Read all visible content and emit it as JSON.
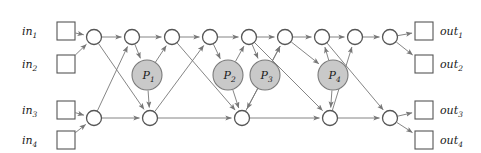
{
  "diagram": {
    "colors": {
      "edge": "#777777",
      "node_stroke": "#555555",
      "node_fill": "#ffffff",
      "processor_fill": "#c9c9c9",
      "processor_stroke": "#7a7a7a",
      "background": "#ffffff",
      "text": "#1a1a1a"
    },
    "inputs": [
      {
        "id": "in1",
        "base": "in",
        "sub": "1",
        "x": 57,
        "y": 22,
        "size": 18
      },
      {
        "id": "in2",
        "base": "in",
        "sub": "2",
        "x": 57,
        "y": 55,
        "size": 18
      },
      {
        "id": "in3",
        "base": "in",
        "sub": "3",
        "x": 57,
        "y": 101,
        "size": 18
      },
      {
        "id": "in4",
        "base": "in",
        "sub": "4",
        "x": 57,
        "y": 131,
        "size": 18
      }
    ],
    "outputs": [
      {
        "id": "out1",
        "base": "out",
        "sub": "1",
        "x": 415,
        "y": 22,
        "size": 18
      },
      {
        "id": "out2",
        "base": "out",
        "sub": "2",
        "x": 415,
        "y": 55,
        "size": 18
      },
      {
        "id": "out3",
        "base": "out",
        "sub": "3",
        "x": 415,
        "y": 101,
        "size": 18
      },
      {
        "id": "out4",
        "base": "out",
        "sub": "4",
        "x": 415,
        "y": 131,
        "size": 18
      }
    ],
    "input_labels": [
      {
        "text": "in",
        "sub": "1",
        "x": 22,
        "y": 35
      },
      {
        "text": "in",
        "sub": "2",
        "x": 22,
        "y": 68
      },
      {
        "text": "in",
        "sub": "3",
        "x": 22,
        "y": 114
      },
      {
        "text": "in",
        "sub": "4",
        "x": 22,
        "y": 144
      }
    ],
    "output_labels": [
      {
        "text": "out",
        "sub": "1",
        "x": 440,
        "y": 35
      },
      {
        "text": "out",
        "sub": "2",
        "x": 440,
        "y": 68
      },
      {
        "text": "out",
        "sub": "3",
        "x": 440,
        "y": 114
      },
      {
        "text": "out",
        "sub": "4",
        "x": 440,
        "y": 144
      }
    ],
    "top_nodes": [
      {
        "id": "t1",
        "x": 94,
        "y": 37,
        "r": 7.5
      },
      {
        "id": "t2",
        "x": 132,
        "y": 37,
        "r": 7.5
      },
      {
        "id": "t3",
        "x": 172,
        "y": 37,
        "r": 7.5
      },
      {
        "id": "t4",
        "x": 210,
        "y": 37,
        "r": 7.5
      },
      {
        "id": "t5",
        "x": 249,
        "y": 37,
        "r": 7.5
      },
      {
        "id": "t6",
        "x": 285,
        "y": 37,
        "r": 7.5
      },
      {
        "id": "t7",
        "x": 322,
        "y": 37,
        "r": 7.5
      },
      {
        "id": "t8",
        "x": 355,
        "y": 37,
        "r": 7.5
      },
      {
        "id": "t9",
        "x": 390,
        "y": 37,
        "r": 7.5
      }
    ],
    "bottom_nodes": [
      {
        "id": "b1",
        "x": 94,
        "y": 118,
        "r": 7.5
      },
      {
        "id": "b2",
        "x": 150,
        "y": 118,
        "r": 7.5
      },
      {
        "id": "b3",
        "x": 242,
        "y": 118,
        "r": 7.5
      },
      {
        "id": "b4",
        "x": 330,
        "y": 118,
        "r": 7.5
      },
      {
        "id": "b5",
        "x": 390,
        "y": 118,
        "r": 7.5
      }
    ],
    "processors": [
      {
        "id": "P1",
        "base": "P",
        "sub": "1",
        "x": 147,
        "y": 75,
        "r": 15
      },
      {
        "id": "P2",
        "base": "P",
        "sub": "2",
        "x": 228,
        "y": 75,
        "r": 15
      },
      {
        "id": "P3",
        "base": "P",
        "sub": "3",
        "x": 265,
        "y": 75,
        "r": 15
      },
      {
        "id": "P4",
        "base": "P",
        "sub": "4",
        "x": 333,
        "y": 75,
        "r": 15
      }
    ],
    "edges": [
      {
        "from": "in1",
        "to": "t1",
        "kind": "input-fanin"
      },
      {
        "from": "in2",
        "to": "t1",
        "kind": "input-fanin"
      },
      {
        "from": "in3",
        "to": "b1",
        "kind": "input-fanin"
      },
      {
        "from": "in4",
        "to": "b1",
        "kind": "input-fanin"
      },
      {
        "from": "t1",
        "to": "t2",
        "kind": "top-chain"
      },
      {
        "from": "t2",
        "to": "t3",
        "kind": "top-chain"
      },
      {
        "from": "t3",
        "to": "t4",
        "kind": "top-chain"
      },
      {
        "from": "t4",
        "to": "t5",
        "kind": "top-chain"
      },
      {
        "from": "t5",
        "to": "t6",
        "kind": "top-chain"
      },
      {
        "from": "t6",
        "to": "t7",
        "kind": "top-chain"
      },
      {
        "from": "t7",
        "to": "t8",
        "kind": "top-chain"
      },
      {
        "from": "t8",
        "to": "t9",
        "kind": "top-chain"
      },
      {
        "from": "b1",
        "to": "b2",
        "kind": "bottom-chain"
      },
      {
        "from": "b2",
        "to": "b3",
        "kind": "bottom-chain"
      },
      {
        "from": "b3",
        "to": "b4",
        "kind": "bottom-chain"
      },
      {
        "from": "b4",
        "to": "b5",
        "kind": "bottom-chain"
      },
      {
        "from": "t1",
        "to": "b2",
        "kind": "cross-down"
      },
      {
        "from": "b1",
        "to": "t2",
        "kind": "cross-up"
      },
      {
        "from": "t2",
        "to": "P1",
        "kind": "to-processor"
      },
      {
        "from": "P1",
        "to": "t3",
        "kind": "from-processor"
      },
      {
        "from": "P1",
        "to": "b2",
        "kind": "from-processor"
      },
      {
        "from": "t3",
        "to": "b3",
        "kind": "cross-down"
      },
      {
        "from": "b2",
        "to": "t4",
        "kind": "cross-up"
      },
      {
        "from": "t4",
        "to": "P2",
        "kind": "to-processor"
      },
      {
        "from": "P2",
        "to": "t5",
        "kind": "from-processor"
      },
      {
        "from": "P2",
        "to": "b3",
        "kind": "from-processor"
      },
      {
        "from": "t5",
        "to": "P3",
        "kind": "to-processor"
      },
      {
        "from": "P3",
        "to": "t6",
        "kind": "from-processor"
      },
      {
        "from": "P3",
        "to": "b3",
        "kind": "from-processor"
      },
      {
        "from": "t5",
        "to": "b4",
        "kind": "cross-down"
      },
      {
        "from": "b3",
        "to": "t6",
        "kind": "cross-up"
      },
      {
        "from": "t6",
        "to": "P4",
        "kind": "to-processor"
      },
      {
        "from": "P4",
        "to": "t7",
        "kind": "from-processor"
      },
      {
        "from": "P4",
        "to": "b4",
        "kind": "from-processor"
      },
      {
        "from": "t7",
        "to": "b5",
        "kind": "cross-down"
      },
      {
        "from": "b4",
        "to": "t8",
        "kind": "cross-up"
      },
      {
        "from": "t9",
        "to": "out1",
        "kind": "output-fanout"
      },
      {
        "from": "t9",
        "to": "out2",
        "kind": "output-fanout"
      },
      {
        "from": "b5",
        "to": "out3",
        "kind": "output-fanout"
      },
      {
        "from": "b5",
        "to": "out4",
        "kind": "output-fanout"
      }
    ]
  }
}
